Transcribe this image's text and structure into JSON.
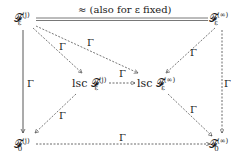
{
  "diagram": {
    "nodes": {
      "top_left": {
        "base": "𝓕",
        "sup": "(j)",
        "sub": "ε"
      },
      "top_right": {
        "base": "𝓕",
        "sup": "(∞)",
        "sub": "ε"
      },
      "mid_left": {
        "prefix": "lsc ",
        "base": "𝓕",
        "sup": "(j)",
        "sub": "ε"
      },
      "mid_right": {
        "prefix": "lsc ",
        "base": "𝓕",
        "sup": "(∞)",
        "sub": "ε"
      },
      "bot_left": {
        "base": "𝓕",
        "sup": "(j)",
        "sub": "0"
      },
      "bot_right": {
        "base": "𝓕",
        "sup": "(∞)",
        "sub": "0"
      }
    },
    "labels": {
      "top_edge": "≈ (also for ε fixed)",
      "gamma": "Γ"
    }
  }
}
